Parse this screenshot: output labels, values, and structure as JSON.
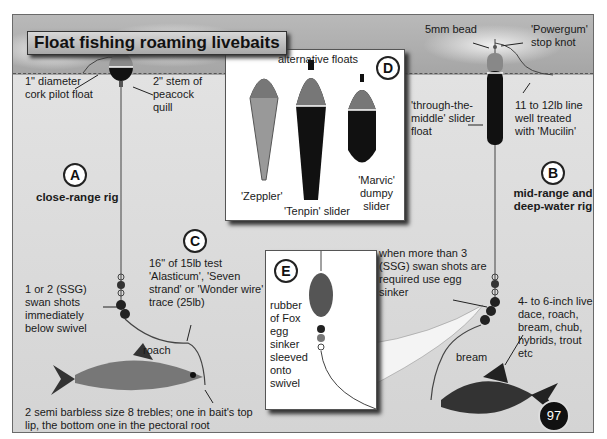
{
  "title": "Float fishing roaming livebaits",
  "page_number": "97",
  "rig_a": {
    "marker": "A",
    "heading": "close-range rig",
    "float_label": "1\" diameter cork pilot float",
    "stem_label": "2\" stem of peacock quill",
    "shots_label": "1 or 2 (SSG) swan shots immediately below swivel",
    "bait_fish": "roach",
    "hooks_label": "2 semi barbless size 8 trebles; one in bait's top lip, the bottom one in the pectoral root"
  },
  "rig_b": {
    "marker": "B",
    "heading": "mid-range and deep-water rig",
    "bead_label": "5mm bead",
    "stop_knot_label": "'Powergum' stop knot",
    "slider_label": "'through-the-middle' slider float",
    "line_label": "11 to 12lb line well treated with 'Mucilin'",
    "egg_sinker_label": "when more than 3 (SSG) swan shots are required use egg sinker",
    "baits_label": "4- to 6-inch live dace, roach, bream, chub, hybrids, trout etc",
    "bait_fish": "bream"
  },
  "trace_c": {
    "marker": "C",
    "label": "16\" of 15lb test 'Alasticum', 'Seven strand' or 'Wonder wire' trace (25lb)"
  },
  "floats_d": {
    "marker": "D",
    "heading": "alternative floats",
    "floats": [
      {
        "name": "'Zeppler'"
      },
      {
        "name": "'Tenpin' slider"
      },
      {
        "name": "'Marvic' dumpy slider"
      }
    ]
  },
  "sinker_e": {
    "marker": "E",
    "label": "rubber of Fox egg sinker sleeved onto swivel"
  }
}
